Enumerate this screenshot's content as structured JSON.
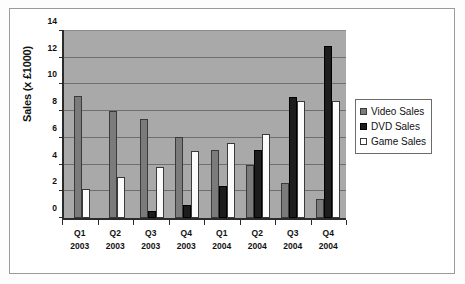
{
  "chart_data": {
    "type": "bar",
    "title": "",
    "xlabel": "",
    "ylabel": "Sales (x £1000)",
    "ylim": [
      0,
      14
    ],
    "ytick_step": 2,
    "yticks": [
      "14",
      "12",
      "10",
      "8",
      "6",
      "4",
      "2",
      "0"
    ],
    "grid": true,
    "legend_position": "right",
    "categories": [
      {
        "quarter": "Q1",
        "year": "2003"
      },
      {
        "quarter": "Q2",
        "year": "2003"
      },
      {
        "quarter": "Q3",
        "year": "2003"
      },
      {
        "quarter": "Q4",
        "year": "2003"
      },
      {
        "quarter": "Q1",
        "year": "2004"
      },
      {
        "quarter": "Q2",
        "year": "2004"
      },
      {
        "quarter": "Q3",
        "year": "2004"
      },
      {
        "quarter": "Q4",
        "year": "2004"
      }
    ],
    "series": [
      {
        "name": "Video Sales",
        "color": "#7b7b7b",
        "values": [
          9.1,
          8.0,
          7.4,
          6.1,
          5.1,
          4.0,
          2.65,
          1.4
        ]
      },
      {
        "name": "DVD Sales",
        "color": "#1d1d1d",
        "values": [
          0,
          0,
          0.5,
          1.0,
          2.4,
          5.1,
          9.05,
          12.9
        ]
      },
      {
        "name": "Game Sales",
        "color": "#ffffff",
        "values": [
          2.2,
          3.1,
          3.85,
          5.0,
          5.6,
          6.3,
          8.75,
          8.75
        ]
      }
    ],
    "plot_background": "#a9a9a9",
    "axis_color": "#2b2b2b"
  }
}
